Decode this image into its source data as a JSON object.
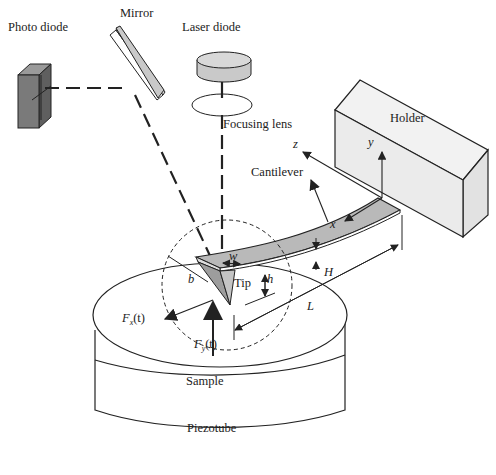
{
  "labels": {
    "photo_diode": "Photo diode",
    "mirror": "Mirror",
    "laser_diode": "Laser diode",
    "focusing_lens": "Focusing lens",
    "holder": "Holder",
    "cantilever": "Cantilever",
    "sample": "Sample",
    "piezotube": "Piezotube",
    "tip": "Tip"
  },
  "symbols": {
    "x": "x",
    "y": "y",
    "z": "z",
    "w": "w",
    "b": "b",
    "h": "h",
    "H": "H",
    "L": "L",
    "fx": "F",
    "fx_sub": "x",
    "fx_arg": "(t)",
    "fy": "F",
    "fy_sub": "y",
    "fy_arg": "(t)"
  },
  "colors": {
    "stroke": "#222222",
    "component_fill": "#c9c9c9",
    "dark_fill": "#7a7a7a",
    "holder_fill": "#efefef"
  }
}
